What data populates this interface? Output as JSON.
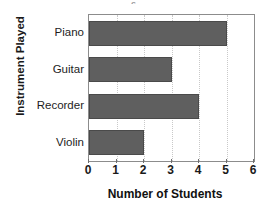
{
  "chart_data": {
    "type": "bar",
    "orientation": "horizontal",
    "title": "",
    "title_fragment": "s",
    "xlabel": "Number of Students",
    "ylabel": "Instrument Played",
    "categories": [
      "Piano",
      "Guitar",
      "Recorder",
      "Violin"
    ],
    "values": [
      5,
      3,
      4,
      2
    ],
    "xlim": [
      0,
      6
    ],
    "xticks": [
      0,
      1,
      2,
      3,
      4,
      5,
      6
    ],
    "xtick_labels": [
      "0",
      "1",
      "2",
      "3",
      "4",
      "5",
      "6"
    ],
    "grid": true,
    "grid_axis": "x",
    "grid_style": "dotted",
    "legend": false,
    "colors": {
      "bar_fill": "#5f5f5f",
      "bar_edge": "#4a4a4a",
      "frame": "#8c8c8c",
      "gridline": "#c9c9c9",
      "text": "#1a1a1a",
      "background": "#ffffff"
    }
  }
}
